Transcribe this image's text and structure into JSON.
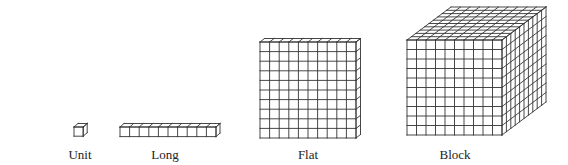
{
  "figure": {
    "line_color": "#333333",
    "background": "#ffffff",
    "pieces": [
      {
        "id": "unit",
        "label": "Unit",
        "cols": 1,
        "rows": 1,
        "depth": 1,
        "label_x": 80
      },
      {
        "id": "long",
        "label": "Long",
        "cols": 10,
        "rows": 1,
        "depth": 1,
        "label_x": 165
      },
      {
        "id": "flat",
        "label": "Flat",
        "cols": 10,
        "rows": 10,
        "depth": 1,
        "label_x": 308
      },
      {
        "id": "block",
        "label": "Block",
        "cols": 10,
        "rows": 10,
        "depth": 10,
        "label_x": 455
      }
    ]
  }
}
